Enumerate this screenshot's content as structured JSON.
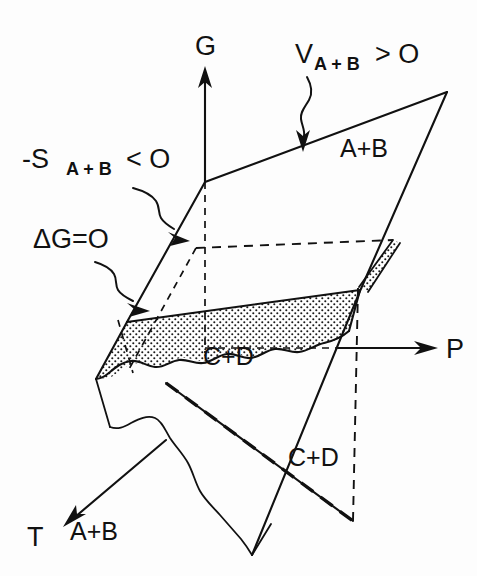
{
  "figure": {
    "background_color": "#fdfdfd",
    "ink_color": "#111111"
  },
  "axes": [
    {
      "id": "G",
      "label": "G",
      "direction": "up",
      "description": "Gibbs free energy axis, vertical"
    },
    {
      "id": "P",
      "label": "P",
      "direction": "right",
      "description": "Pressure axis, horizontal to the right"
    },
    {
      "id": "T",
      "label": "T",
      "direction": "down-left",
      "description": "Temperature axis, toward lower left"
    }
  ],
  "annotations": {
    "volume_condition": {
      "symbol": "V",
      "subscript": "A + B",
      "relation": "> O",
      "full": "V A+B > O"
    },
    "entropy_condition": {
      "symbol": "-S",
      "subscript": "A + B",
      "relation": "< O",
      "full": "-S A+B < O"
    },
    "equilibrium_condition": {
      "full": "ΔG=O"
    }
  },
  "plane_labels": {
    "upper_plane": "A+B",
    "shaded_plane": "C+D",
    "lower_left_plane": "A+B",
    "lower_right_plane": "C+D"
  },
  "features": {
    "shaded_region_pattern": "stipple-dots",
    "torn_edge": "wavy",
    "hidden_lines": "dashed"
  },
  "icons": {
    "g_axis_arrow": "arrow-up-icon",
    "p_axis_arrow": "arrow-right-icon",
    "t_axis_arrow": "arrow-down-left-icon",
    "volume_leader_arrow": "squiggle-arrow-down-icon",
    "entropy_leader_arrow": "squiggle-arrow-down-right-icon",
    "equilibrium_leader_arrow": "squiggle-arrow-up-right-icon"
  }
}
